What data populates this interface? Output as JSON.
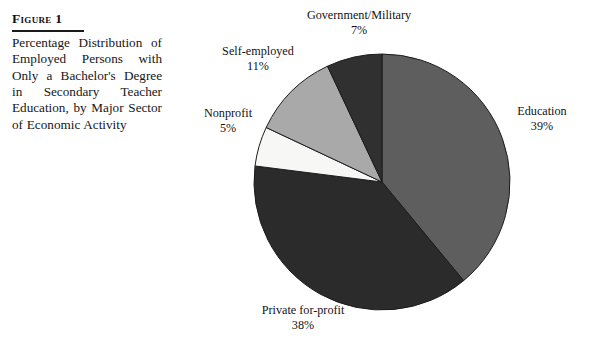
{
  "figure": {
    "label": "Figure 1",
    "caption": "Percentage Distribution of Employed Persons with Only a Bachelor's Degree in Secondary Teacher Education, by Major Sector of Economic Activity"
  },
  "chart_data": {
    "type": "pie",
    "title": "Percentage Distribution of Employed Persons with Only a Bachelor's Degree in Secondary Teacher Education, by Major Sector of Economic Activity",
    "xlabel": "",
    "ylabel": "",
    "unit": "percent",
    "start_angle_deg": 0,
    "direction": "clockwise",
    "legend": "none",
    "grid": false,
    "categories": [
      "Education",
      "Private for-profit",
      "Nonprofit",
      "Self-employed",
      "Government/Military"
    ],
    "values": [
      39,
      38,
      5,
      11,
      7
    ],
    "colors": [
      "#5e5e5e",
      "#2b2b2b",
      "#f7f7f5",
      "#a9a9a9",
      "#303030"
    ],
    "slices": [
      {
        "name": "Education",
        "value": 39,
        "label": "Education",
        "pct_text": "39%",
        "color": "#5e5e5e"
      },
      {
        "name": "Private for-profit",
        "value": 38,
        "label": "Private for-profit",
        "pct_text": "38%",
        "color": "#2b2b2b"
      },
      {
        "name": "Nonprofit",
        "value": 5,
        "label": "Nonprofit",
        "pct_text": "5%",
        "color": "#f7f7f5"
      },
      {
        "name": "Self-employed",
        "value": 11,
        "label": "Self-employed",
        "pct_text": "11%",
        "color": "#a9a9a9"
      },
      {
        "name": "Government/Military",
        "value": 7,
        "label": "Government/Military",
        "pct_text": "7%",
        "color": "#303030"
      }
    ]
  }
}
